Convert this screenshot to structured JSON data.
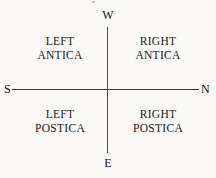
{
  "diagram": {
    "type": "compass-quadrant-diagram",
    "background_color": "#fbfaf6",
    "line_color": "#3f3f3f",
    "text_color": "#171717",
    "compass_labels": {
      "top": "W",
      "bottom": "E",
      "left": "S",
      "right": "N"
    },
    "quadrants": [
      {
        "position": "top-left",
        "line1": "LEFT",
        "line2": "ANTICA"
      },
      {
        "position": "top-right",
        "line1": "RIGHT",
        "line2": "ANTICA"
      },
      {
        "position": "bottom-left",
        "line1": "LEFT",
        "line2": "POSTICA"
      },
      {
        "position": "bottom-right",
        "line1": "RIGHT",
        "line2": "POSTICA"
      }
    ]
  }
}
